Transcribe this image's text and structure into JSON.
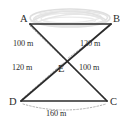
{
  "figure": {
    "unit": "m",
    "colors": {
      "solid_line": "#2b2b2b",
      "dotted_line": "#a8a8a8",
      "text": "#2b2b2b",
      "sketch_fill": "#cfcfcf",
      "background": "#ffffff"
    },
    "vertices": [
      {
        "id": "A",
        "label": "A",
        "x": 29,
        "y": 23
      },
      {
        "id": "B",
        "label": "B",
        "x": 112,
        "y": 23
      },
      {
        "id": "C",
        "label": "C",
        "x": 108,
        "y": 101
      },
      {
        "id": "D",
        "label": "D",
        "x": 20,
        "y": 101
      },
      {
        "id": "E",
        "label": "E",
        "x": 65,
        "y": 61
      }
    ],
    "solid_edges": [
      {
        "from": "A",
        "to": "B",
        "name": "edge-ab"
      },
      {
        "from": "D",
        "to": "C",
        "name": "edge-dc"
      },
      {
        "from": "A",
        "to": "C",
        "name": "diagonal-ac"
      },
      {
        "from": "B",
        "to": "D",
        "name": "diagonal-bd"
      }
    ],
    "dotted_measures": [
      {
        "id": "AE",
        "from": "A",
        "to": "E",
        "label": "100 m",
        "value": 100
      },
      {
        "id": "BE",
        "from": "B",
        "to": "E",
        "label": "120 m",
        "value": 120
      },
      {
        "id": "DE",
        "from": "D",
        "to": "E",
        "label": "120 m",
        "value": 120
      },
      {
        "id": "CE",
        "from": "C",
        "to": "E",
        "label": "100 m",
        "value": 100
      },
      {
        "id": "DC",
        "from": "D",
        "to": "C",
        "label": "160 m",
        "value": 160
      }
    ],
    "sketch_region": {
      "name": "pond-sketch",
      "description": "hand-drawn elliptical shading above segment AB"
    }
  }
}
